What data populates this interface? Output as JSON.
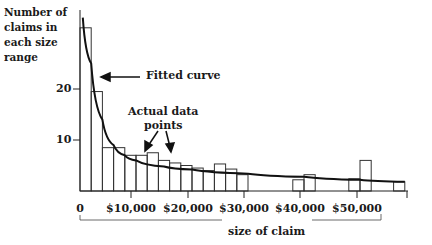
{
  "chart_data": {
    "type": "bar",
    "title": "",
    "ylabel": "Number of claims in each size range",
    "xlabel": "size of claim",
    "x_ticks": [
      "0",
      "$10,000",
      "$20,000",
      "$30,000",
      "$40,000",
      "$50,000"
    ],
    "y_ticks": [
      "10",
      "20"
    ],
    "ylim": [
      0,
      35
    ],
    "xlim": [
      0,
      58000
    ],
    "bin_width": 2000,
    "categories": [
      "0-2k",
      "2k-4k",
      "4k-6k",
      "6k-8k",
      "8k-10k",
      "10k-12k",
      "12k-14k",
      "14k-16k",
      "16k-18k",
      "18k-20k",
      "20k-22k",
      "22k-24k",
      "24k-26k",
      "26k-28k",
      "28k-30k",
      "30k-32k",
      "32k-34k",
      "34k-36k",
      "36k-38k",
      "38k-40k",
      "40k-42k",
      "42k-44k",
      "44k-46k",
      "46k-48k",
      "48k-50k",
      "50k-52k",
      "52k-54k",
      "54k-56k",
      "56k-58k"
    ],
    "series": [
      {
        "name": "Actual data points",
        "type": "bar",
        "values": [
          32,
          19.5,
          8.5,
          8.5,
          7,
          7,
          7.5,
          6,
          5.5,
          5,
          4.5,
          4,
          5.3,
          4.3,
          3.2,
          0,
          0,
          0,
          0,
          2.2,
          3.2,
          0,
          0,
          0,
          2.4,
          6,
          0,
          0,
          1.8
        ]
      },
      {
        "name": "Fitted curve",
        "type": "line",
        "x": [
          500,
          2000,
          4000,
          6000,
          8000,
          10000,
          15000,
          20000,
          30000,
          40000,
          50000,
          58000
        ],
        "values": [
          34,
          25,
          14,
          9,
          7,
          6,
          4.8,
          4.2,
          3.4,
          2.8,
          2.2,
          1.8
        ]
      }
    ],
    "annotations": [
      "Fitted curve",
      "Actual data points"
    ],
    "grid": false,
    "legend": "none"
  },
  "labels": {
    "ylabel": "Number of\nclaims in\neach size\nrange",
    "y10": "10",
    "y20": "20",
    "x0": "0",
    "x10": "$10,000",
    "x20": "$20,000",
    "x30": "$30,000",
    "x40": "$40,000",
    "x50": "$50,000",
    "xlabel": "size of claim",
    "fitted": "Fitted curve",
    "actual": "Actual data\npoints"
  }
}
